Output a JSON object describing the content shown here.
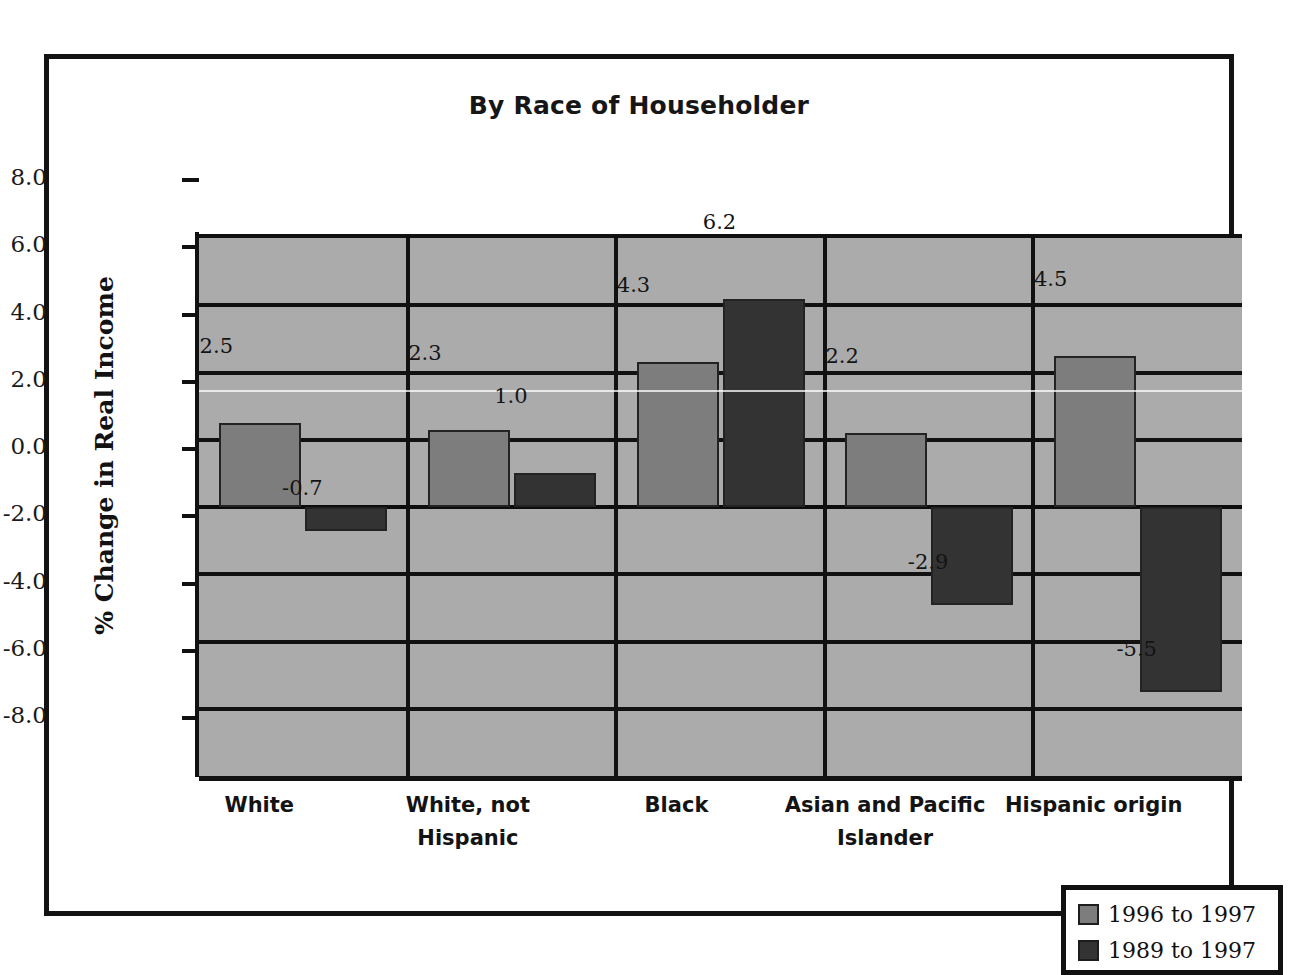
{
  "chart_data": {
    "type": "bar",
    "title": "By Race of Householder",
    "xlabel": "",
    "ylabel": "% Change in Real Income",
    "ylim": [
      -8.0,
      8.0
    ],
    "ytick_labels": [
      "8.0",
      "6.0",
      "4.0",
      "2.0",
      "0.0",
      "-2.0",
      "-4.0",
      "-6.0",
      "-8.0"
    ],
    "ytick_values": [
      8.0,
      6.0,
      4.0,
      2.0,
      0.0,
      -2.0,
      -4.0,
      -6.0,
      -8.0
    ],
    "grid": true,
    "legend_position": "bottom-right",
    "categories": [
      "White",
      "White, not Hispanic",
      "Black",
      "Asian and Pacific Islander",
      "Hispanic origin"
    ],
    "category_lines": [
      [
        "White"
      ],
      [
        "White, not",
        "Hispanic"
      ],
      [
        "Black"
      ],
      [
        "Asian and Pacific",
        "Islander"
      ],
      [
        "Hispanic origin"
      ]
    ],
    "series": [
      {
        "name": "1996 to 1997",
        "color": "#7d7d7d",
        "values": [
          2.5,
          2.3,
          4.3,
          2.2,
          4.5
        ],
        "labels": [
          "2.5",
          "2.3",
          "4.3",
          "2.2",
          "4.5"
        ]
      },
      {
        "name": "1989 to 1997",
        "color": "#333333",
        "values": [
          -0.7,
          1.0,
          6.2,
          -2.9,
          -5.5
        ],
        "labels": [
          "-0.7",
          "1.0",
          "6.2",
          "-2.9",
          "-5.5"
        ]
      }
    ]
  },
  "legend": {
    "entries": [
      {
        "label": "1996 to 1997"
      },
      {
        "label": "1989 to 1997"
      }
    ]
  },
  "colors": {
    "plot_background": "#ababab",
    "grid": "#111111",
    "frame": "#131313",
    "page_background": "#ffffff",
    "series_1": "#7d7d7d",
    "series_2": "#333333"
  }
}
